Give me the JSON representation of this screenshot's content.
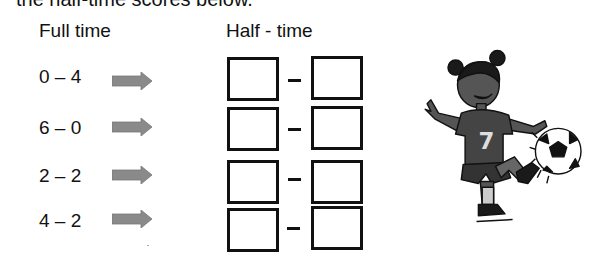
{
  "intro_text": "the half-time scores below.",
  "headers": {
    "full_time": "Full time",
    "half_time": "Half - time"
  },
  "rows": [
    {
      "full_time": "0 – 4",
      "half_home": "",
      "half_away": ""
    },
    {
      "full_time": "6 – 0",
      "half_home": "",
      "half_away": ""
    },
    {
      "full_time": "2 – 2",
      "half_home": "",
      "half_away": ""
    },
    {
      "full_time": "4 – 2",
      "half_home": "",
      "half_away": ""
    }
  ],
  "separator": "–",
  "illustration": {
    "subject": "girl kicking soccer ball",
    "shirt_number": "7"
  },
  "colors": {
    "arrow": "#8a8a8a",
    "box_border": "#111111",
    "text": "#111111"
  }
}
